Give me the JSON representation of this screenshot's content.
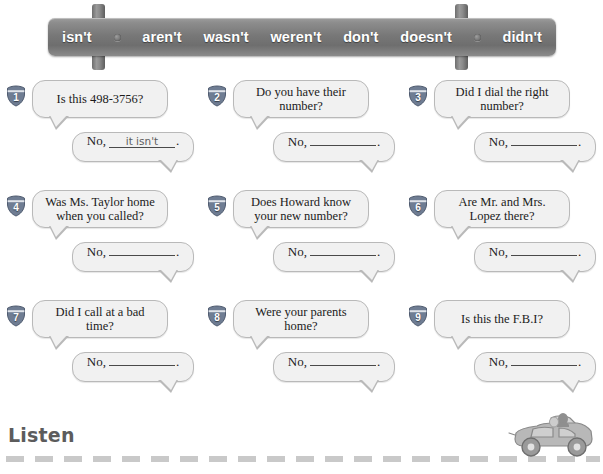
{
  "word_bank": {
    "name": "contractions-word-bank",
    "words": [
      "isn't",
      "aren't",
      "wasn't",
      "weren't",
      "don't",
      "doesn't",
      "didn't"
    ],
    "sign_color": "#7d7d7d",
    "text_color": "#ffffff"
  },
  "exercises": [
    {
      "number": "1",
      "question": "Is this 498-3756?",
      "answer_prefix": "No,",
      "answer_value": "it isn't",
      "answer_filled": true,
      "answer_punct": "."
    },
    {
      "number": "2",
      "question": "Do you have their number?",
      "answer_prefix": "No,",
      "answer_value": "",
      "answer_filled": false,
      "answer_punct": "."
    },
    {
      "number": "3",
      "question": "Did I dial the right number?",
      "answer_prefix": "No,",
      "answer_value": "",
      "answer_filled": false,
      "answer_punct": "."
    },
    {
      "number": "4",
      "question": "Was Ms. Taylor home when you called?",
      "answer_prefix": "No,",
      "answer_value": "",
      "answer_filled": false,
      "answer_punct": "."
    },
    {
      "number": "5",
      "question": "Does Howard know your new number?",
      "answer_prefix": "No,",
      "answer_value": "",
      "answer_filled": false,
      "answer_punct": "."
    },
    {
      "number": "6",
      "question": "Are Mr. and Mrs. Lopez there?",
      "answer_prefix": "No,",
      "answer_value": "",
      "answer_filled": false,
      "answer_punct": "."
    },
    {
      "number": "7",
      "question": "Did I call at a bad time?",
      "answer_prefix": "No,",
      "answer_value": "",
      "answer_filled": false,
      "answer_punct": "."
    },
    {
      "number": "8",
      "question": "Were your parents home?",
      "answer_prefix": "No,",
      "answer_value": "",
      "answer_filled": false,
      "answer_punct": "."
    },
    {
      "number": "9",
      "question": "Is this the F.B.I?",
      "answer_prefix": "No,",
      "answer_value": "",
      "answer_filled": false,
      "answer_punct": "."
    }
  ],
  "footer": {
    "heading": "Listen",
    "heading_color": "#5c5c5c",
    "road_color": "#c9c9c9",
    "car_icon": "convertible-car-icon"
  }
}
